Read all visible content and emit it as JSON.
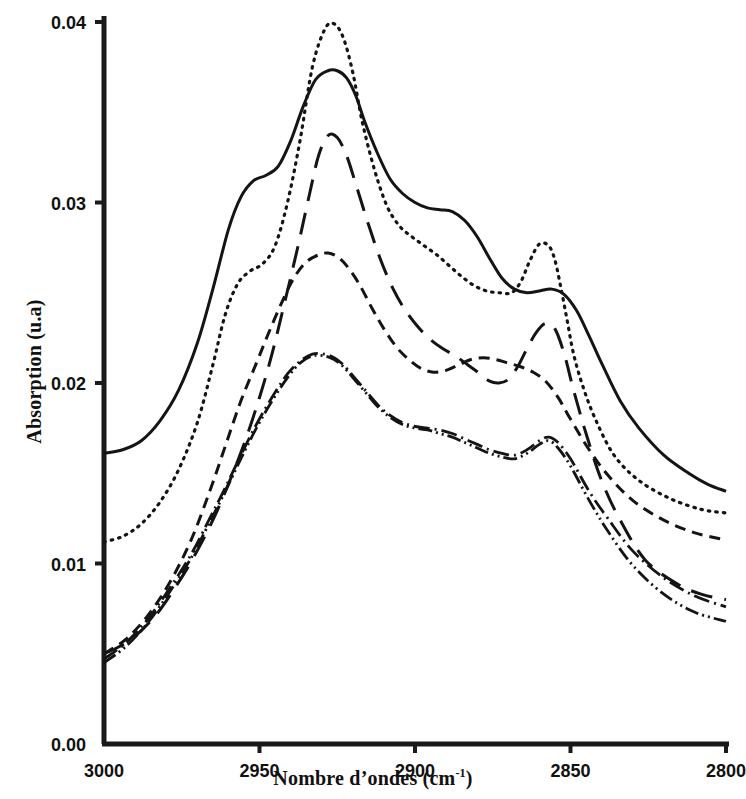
{
  "chart_data": {
    "type": "line",
    "title": "",
    "xlabel": "Nombre d'ondes (cm-1)",
    "xlabel_base": "Nombre d’ondes (cm",
    "xlabel_sup": "-1",
    "xlabel_close": ")",
    "ylabel": "Absorption (u.a)",
    "xlim": [
      3000,
      2800
    ],
    "ylim": [
      0.0,
      0.04
    ],
    "x_inverted": true,
    "grid": false,
    "legend": "none",
    "xticks": [
      3000,
      2950,
      2900,
      2850,
      2800
    ],
    "xtick_labels": [
      "3000",
      "2950",
      "2900",
      "2850",
      "2800"
    ],
    "yticks": [
      0.0,
      0.01,
      0.02,
      0.03,
      0.04
    ],
    "ytick_labels": [
      "0.00",
      "0.01",
      "0.02",
      "0.03",
      "0.04"
    ],
    "line_color": "#141414",
    "axis_color": "#1a1a1a",
    "series": [
      {
        "name": "curve-1-solid",
        "style": "solid",
        "dasharray": "",
        "width": 3.0,
        "x": [
          3000,
          2994,
          2988,
          2982,
          2976,
          2970,
          2965,
          2960,
          2956,
          2952,
          2948,
          2944,
          2940,
          2936,
          2932,
          2928,
          2925,
          2922,
          2919,
          2916,
          2912,
          2908,
          2904,
          2900,
          2896,
          2892,
          2888,
          2884,
          2880,
          2876,
          2872,
          2868,
          2864,
          2860,
          2856,
          2852,
          2848,
          2844,
          2840,
          2834,
          2828,
          2820,
          2812,
          2806,
          2800
        ],
        "y": [
          0.0161,
          0.0163,
          0.0168,
          0.0179,
          0.0196,
          0.0222,
          0.0252,
          0.0285,
          0.0303,
          0.0312,
          0.0315,
          0.032,
          0.0334,
          0.0353,
          0.0368,
          0.0373,
          0.0373,
          0.0369,
          0.0359,
          0.0344,
          0.0327,
          0.0313,
          0.0305,
          0.03,
          0.0297,
          0.0296,
          0.0295,
          0.029,
          0.0281,
          0.0269,
          0.0258,
          0.0252,
          0.025,
          0.0251,
          0.0252,
          0.0249,
          0.024,
          0.0226,
          0.0211,
          0.019,
          0.0175,
          0.016,
          0.015,
          0.0144,
          0.014
        ]
      },
      {
        "name": "curve-2-dotted",
        "style": "dotted",
        "dasharray": "1.5 6",
        "width": 3.2,
        "x": [
          3000,
          2994,
          2988,
          2982,
          2976,
          2970,
          2965,
          2961,
          2957,
          2953,
          2949,
          2945,
          2941,
          2937,
          2933,
          2929,
          2926,
          2923,
          2920,
          2917,
          2913,
          2909,
          2905,
          2901,
          2897,
          2893,
          2889,
          2885,
          2881,
          2877,
          2873,
          2869,
          2866,
          2863,
          2860,
          2857,
          2855,
          2853,
          2851,
          2849,
          2846,
          2842,
          2836,
          2828,
          2818,
          2808,
          2800
        ],
        "y": [
          0.0112,
          0.0115,
          0.0122,
          0.0134,
          0.0152,
          0.0178,
          0.021,
          0.0238,
          0.0255,
          0.0262,
          0.0266,
          0.0276,
          0.03,
          0.0334,
          0.0375,
          0.0396,
          0.0399,
          0.0391,
          0.0372,
          0.0345,
          0.0318,
          0.0298,
          0.0287,
          0.0281,
          0.0276,
          0.0271,
          0.0265,
          0.0259,
          0.0254,
          0.0251,
          0.025,
          0.025,
          0.0256,
          0.0268,
          0.0277,
          0.0276,
          0.0268,
          0.0252,
          0.0234,
          0.0216,
          0.0198,
          0.018,
          0.016,
          0.0146,
          0.0136,
          0.013,
          0.0128
        ]
      },
      {
        "name": "curve-3-short-dash",
        "style": "dashed-short",
        "dasharray": "11 7",
        "width": 3.0,
        "x": [
          3000,
          2993,
          2986,
          2979,
          2972,
          2966,
          2961,
          2956,
          2951,
          2947,
          2943,
          2939,
          2935,
          2931,
          2928,
          2925,
          2922,
          2918,
          2914,
          2910,
          2906,
          2902,
          2898,
          2894,
          2890,
          2886,
          2882,
          2878,
          2874,
          2870,
          2866,
          2862,
          2858,
          2854,
          2850,
          2844,
          2838,
          2830,
          2820,
          2810,
          2800
        ],
        "y": [
          0.005,
          0.0058,
          0.0071,
          0.0089,
          0.0113,
          0.014,
          0.0165,
          0.019,
          0.0211,
          0.0228,
          0.0244,
          0.0258,
          0.0267,
          0.0271,
          0.0272,
          0.027,
          0.0265,
          0.0255,
          0.0242,
          0.023,
          0.022,
          0.0213,
          0.0208,
          0.0206,
          0.0207,
          0.021,
          0.0213,
          0.0214,
          0.0213,
          0.0211,
          0.0209,
          0.0206,
          0.0201,
          0.0192,
          0.018,
          0.0163,
          0.0149,
          0.0135,
          0.0124,
          0.0117,
          0.0113
        ]
      },
      {
        "name": "curve-4-long-dash",
        "style": "dashed-long",
        "dasharray": "22 12",
        "width": 3.0,
        "x": [
          3000,
          2992,
          2984,
          2977,
          2971,
          2965,
          2960,
          2955,
          2950,
          2946,
          2942,
          2938,
          2934,
          2931,
          2928,
          2925,
          2922,
          2919,
          2915,
          2911,
          2907,
          2903,
          2899,
          2895,
          2891,
          2887,
          2883,
          2879,
          2876,
          2873,
          2870,
          2867,
          2864,
          2861,
          2858,
          2855,
          2852,
          2849,
          2845,
          2840,
          2834,
          2826,
          2816,
          2808,
          2800
        ],
        "y": [
          0.005,
          0.0057,
          0.007,
          0.0087,
          0.0104,
          0.0124,
          0.0144,
          0.0166,
          0.0192,
          0.0216,
          0.0244,
          0.0273,
          0.0304,
          0.0326,
          0.0337,
          0.0336,
          0.0326,
          0.031,
          0.0288,
          0.0268,
          0.0252,
          0.024,
          0.0231,
          0.0224,
          0.0219,
          0.0215,
          0.021,
          0.0205,
          0.0201,
          0.02,
          0.0202,
          0.0209,
          0.0219,
          0.0228,
          0.0233,
          0.023,
          0.0216,
          0.0196,
          0.0172,
          0.0146,
          0.0124,
          0.0102,
          0.0089,
          0.0083,
          0.008
        ]
      },
      {
        "name": "curve-5-dash-dot",
        "style": "dash-dot",
        "dasharray": "16 5 2 5",
        "width": 2.8,
        "x": [
          3000,
          2993,
          2986,
          2979,
          2972,
          2966,
          2961,
          2956,
          2951,
          2946,
          2941,
          2937,
          2933,
          2929,
          2926,
          2923,
          2920,
          2916,
          2912,
          2908,
          2904,
          2900,
          2896,
          2892,
          2888,
          2884,
          2880,
          2876,
          2872,
          2868,
          2864,
          2860,
          2857,
          2854,
          2850,
          2844,
          2838,
          2830,
          2820,
          2810,
          2800
        ],
        "y": [
          0.0047,
          0.0056,
          0.0069,
          0.0086,
          0.0105,
          0.0125,
          0.0142,
          0.016,
          0.0177,
          0.0192,
          0.0205,
          0.0212,
          0.0216,
          0.0216,
          0.0214,
          0.021,
          0.0204,
          0.0196,
          0.0188,
          0.0182,
          0.0178,
          0.0176,
          0.0175,
          0.0174,
          0.0172,
          0.0169,
          0.0166,
          0.0163,
          0.0161,
          0.016,
          0.0163,
          0.0168,
          0.017,
          0.0167,
          0.0158,
          0.014,
          0.0125,
          0.0107,
          0.0092,
          0.0082,
          0.0076
        ]
      },
      {
        "name": "curve-6-dash-dot-dot",
        "style": "dash-dot-dot",
        "dasharray": "14 4 2 4 2 4",
        "width": 2.8,
        "x": [
          3000,
          2993,
          2986,
          2979,
          2972,
          2966,
          2961,
          2956,
          2951,
          2946,
          2941,
          2937,
          2933,
          2929,
          2926,
          2923,
          2920,
          2916,
          2912,
          2908,
          2904,
          2900,
          2896,
          2892,
          2888,
          2884,
          2880,
          2876,
          2872,
          2868,
          2864,
          2860,
          2857,
          2854,
          2850,
          2844,
          2838,
          2830,
          2820,
          2810,
          2800
        ],
        "y": [
          0.0045,
          0.0054,
          0.0067,
          0.0084,
          0.0103,
          0.0123,
          0.014,
          0.0158,
          0.0175,
          0.019,
          0.0203,
          0.0211,
          0.0215,
          0.0215,
          0.0213,
          0.0209,
          0.0203,
          0.0195,
          0.0187,
          0.0181,
          0.0177,
          0.0175,
          0.0174,
          0.0172,
          0.017,
          0.0167,
          0.0164,
          0.0161,
          0.0159,
          0.0158,
          0.0161,
          0.0166,
          0.0168,
          0.0164,
          0.0154,
          0.0135,
          0.0118,
          0.0099,
          0.0083,
          0.0073,
          0.0068
        ]
      }
    ]
  }
}
